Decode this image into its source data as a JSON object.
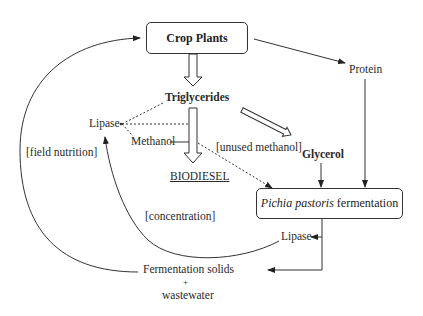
{
  "diagram": {
    "type": "flow",
    "nodes": {
      "crop_plants": "Crop Plants",
      "triglycerides": "Triglycerides",
      "biodiesel": "BIODIESEL",
      "lipase_left": "Lipase",
      "methanol": "Methanol",
      "unused_methanol": "[unused methanol]",
      "glycerol": "Glycerol",
      "protein": "Protein",
      "fermentation_italic": "Pichia pastoris",
      "fermentation_rest": " fermentation",
      "lipase_right": "Lipase",
      "fermentation_solids": "Fermentation solids",
      "plus": "+",
      "wastewater": "wastewater",
      "field_nutrition": "[field nutrition]",
      "concentration": "[concentration]"
    },
    "edges": [
      {
        "from": "Crop Plants",
        "to": "Triglycerides",
        "style": "hollow-arrow"
      },
      {
        "from": "Triglycerides",
        "to": "BIODIESEL",
        "style": "hollow-arrow"
      },
      {
        "from": "Triglycerides",
        "to": "Glycerol",
        "style": "hollow-arrow"
      },
      {
        "from": "Crop Plants",
        "to": "Protein",
        "style": "solid-arrow"
      },
      {
        "from": "Protein",
        "to": "Pichia pastoris fermentation",
        "style": "solid-arrow"
      },
      {
        "from": "Glycerol",
        "to": "Pichia pastoris fermentation",
        "style": "solid-arrow"
      },
      {
        "from": "Methanol",
        "to": "Pichia pastoris fermentation",
        "label": "[unused methanol]",
        "style": "dotted-arrow"
      },
      {
        "from": "Lipase",
        "to": "Triglycerides",
        "style": "dotted"
      },
      {
        "from": "Lipase",
        "to": "Methanol",
        "style": "dotted"
      },
      {
        "from": "Pichia pastoris fermentation",
        "to": "Lipase",
        "style": "solid-arrow"
      },
      {
        "from": "Pichia pastoris fermentation",
        "to": "Fermentation solids + wastewater",
        "style": "solid-arrow"
      },
      {
        "from": "Lipase",
        "to": "Lipase",
        "label": "[concentration]",
        "style": "curved-arrow"
      },
      {
        "from": "Fermentation solids + wastewater",
        "to": "Crop Plants",
        "label": "[field nutrition]",
        "style": "curved-arrow"
      }
    ]
  }
}
